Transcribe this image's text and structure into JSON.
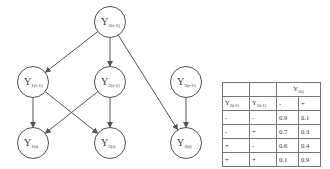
{
  "diagram": {
    "nodes": [
      {
        "id": "Y2_t-2",
        "base": "Y",
        "sub": "2(t-2)",
        "cx": 110,
        "cy": 22
      },
      {
        "id": "Y1_t-1",
        "base": "Y",
        "sub": "1(t-1)",
        "cx": 33,
        "cy": 82
      },
      {
        "id": "Y2_t-1",
        "base": "Y",
        "sub": "2(t-1)",
        "cx": 110,
        "cy": 82
      },
      {
        "id": "Y3_t-1",
        "base": "Y",
        "sub": "3(t-1)",
        "cx": 186,
        "cy": 82
      },
      {
        "id": "Y1_t",
        "base": "Y",
        "sub": "1(t)",
        "cx": 33,
        "cy": 143
      },
      {
        "id": "Y2_t",
        "base": "Y",
        "sub": "2(t)",
        "cx": 110,
        "cy": 143
      },
      {
        "id": "Y3_t",
        "base": "Y",
        "sub": "3(t)",
        "cx": 186,
        "cy": 143
      }
    ],
    "edges": [
      [
        "Y2_t-2",
        "Y1_t-1"
      ],
      [
        "Y2_t-2",
        "Y2_t-1"
      ],
      [
        "Y2_t-2",
        "Y3_t"
      ],
      [
        "Y1_t-1",
        "Y1_t"
      ],
      [
        "Y1_t-1",
        "Y2_t"
      ],
      [
        "Y2_t-1",
        "Y1_t"
      ],
      [
        "Y2_t-1",
        "Y2_t"
      ],
      [
        "Y3_t-1",
        "Y3_t"
      ]
    ]
  },
  "cpt": {
    "header_top": {
      "target_base": "Y",
      "target_sub": "3(t)"
    },
    "header": {
      "p1_base": "Y",
      "p1_sub": "2(t-2)",
      "p2_base": "Y",
      "p2_sub": "3(t-1)",
      "minus": "-",
      "plus": "+"
    },
    "rows": [
      {
        "a": "-",
        "b": "-",
        "neg": "0.9",
        "pos": "0.1"
      },
      {
        "a": "-",
        "b": "+",
        "neg": "0.7",
        "pos": "0.3"
      },
      {
        "a": "+",
        "b": "-",
        "neg": "0.6",
        "pos": "0.4"
      },
      {
        "a": "+",
        "b": "+",
        "neg": "0.1",
        "pos": "0.9"
      }
    ]
  }
}
